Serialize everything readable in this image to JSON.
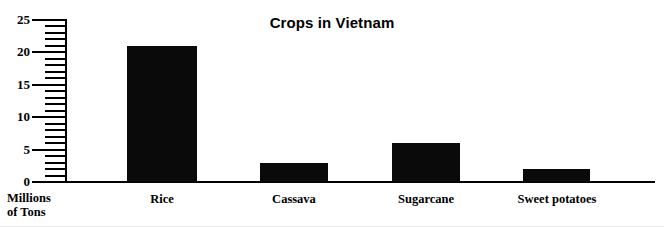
{
  "chart_data": {
    "type": "bar",
    "title": "Crops in Vietnam",
    "xlabel": "",
    "ylabel": "Millions\nof Tons",
    "categories": [
      "Rice",
      "Cassava",
      "Sugarcane",
      "Sweet potatoes"
    ],
    "values": [
      21,
      3,
      6,
      2
    ],
    "ylim": [
      0,
      25
    ],
    "y_major_ticks": [
      0,
      5,
      10,
      15,
      20,
      25
    ],
    "y_major_tick_labels": [
      "0",
      "5",
      "10",
      "15",
      "20",
      "25"
    ],
    "y_minor_tick_step": 1,
    "grid": false,
    "legend": false,
    "series": [
      {
        "name": "Production",
        "values": [
          21,
          3,
          6,
          2
        ]
      }
    ],
    "bar_color": "#0a0a0a",
    "axis_color": "#000000",
    "background_color": "#ffffff"
  },
  "colors": {
    "bar": "#0a0a0a",
    "axis": "#000000",
    "text": "#000000",
    "background": "#ffffff"
  }
}
